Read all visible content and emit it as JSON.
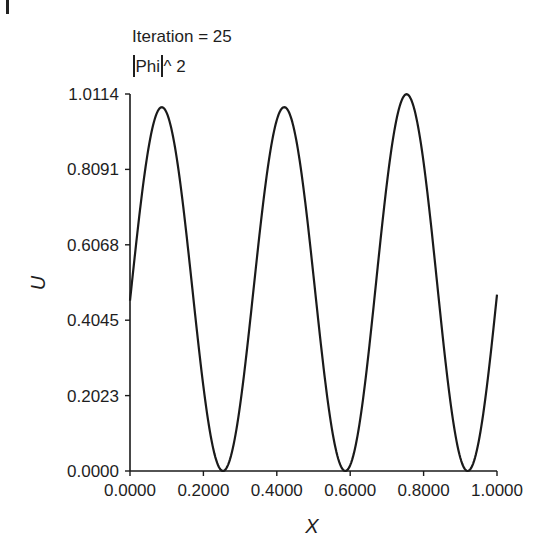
{
  "chart_data": {
    "type": "line",
    "title_lines": [
      "Iteration = 25",
      "|Phi|^ 2"
    ],
    "title": "Iteration = 25",
    "subtitle": "|Phi|^ 2",
    "xlabel": "X",
    "ylabel": "U",
    "xlim": [
      0.0,
      1.0
    ],
    "ylim": [
      0.0,
      1.0114
    ],
    "grid": false,
    "legend": null,
    "x_ticks": [
      "0.0000",
      "0.2000",
      "0.4000",
      "0.6000",
      "0.8000",
      "1.0000"
    ],
    "y_ticks": [
      "0.0000",
      "0.2023",
      "0.4045",
      "0.6068",
      "0.8091",
      "1.0114"
    ],
    "series": [
      {
        "name": "|Phi|^2",
        "x": [
          0.0,
          0.025,
          0.05,
          0.075,
          0.0867,
          0.1,
          0.125,
          0.15,
          0.175,
          0.2,
          0.225,
          0.253,
          0.275,
          0.3,
          0.325,
          0.35,
          0.375,
          0.42,
          0.45,
          0.475,
          0.5,
          0.525,
          0.55,
          0.587,
          0.6,
          0.625,
          0.65,
          0.675,
          0.7,
          0.725,
          0.753,
          0.775,
          0.8,
          0.825,
          0.85,
          0.875,
          0.9,
          0.92,
          0.94,
          0.96,
          0.98,
          1.0
        ],
        "values": [
          0.46,
          0.71,
          0.89,
          0.97,
          0.976,
          0.97,
          0.86,
          0.67,
          0.43,
          0.21,
          0.05,
          0.0,
          0.05,
          0.21,
          0.43,
          0.67,
          0.86,
          0.976,
          0.92,
          0.78,
          0.56,
          0.34,
          0.14,
          0.0,
          0.02,
          0.13,
          0.33,
          0.56,
          0.78,
          0.94,
          1.011,
          0.98,
          0.86,
          0.66,
          0.43,
          0.22,
          0.06,
          0.0,
          0.04,
          0.15,
          0.29,
          0.46
        ]
      }
    ]
  }
}
